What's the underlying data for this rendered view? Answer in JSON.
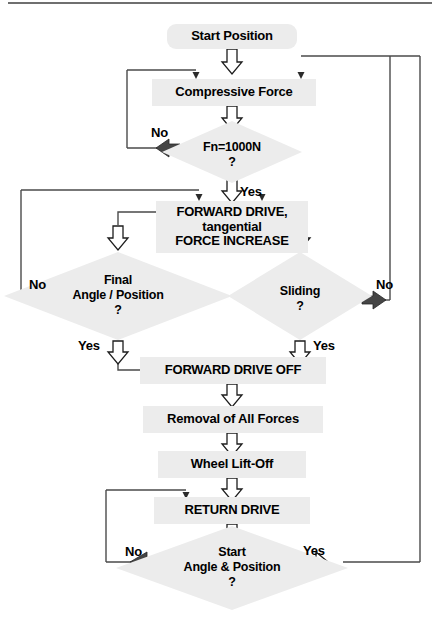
{
  "diagram": {
    "colors": {
      "node_fill": "#ececec",
      "line": "#3b3b3b",
      "arrow_hollow_fill": "#ffffff",
      "arrow_hollow_stroke": "#1a1a1a",
      "arrow_solid_fill": "#404040",
      "text": "#000000",
      "background": "#ffffff"
    },
    "nodes": [
      {
        "id": "start",
        "shape": "rounded-rect",
        "label": "Start Position"
      },
      {
        "id": "compressive",
        "shape": "rect",
        "label": "Compressive Force"
      },
      {
        "id": "fn_check",
        "shape": "diamond",
        "label": "Fn=1000N\n?"
      },
      {
        "id": "forward_drive",
        "shape": "rect",
        "label": "FORWARD DRIVE,\ntangential\nFORCE INCREASE"
      },
      {
        "id": "final_angle",
        "shape": "diamond",
        "label": "Final\nAngle / Position\n?"
      },
      {
        "id": "sliding",
        "shape": "diamond",
        "label": "Sliding\n?"
      },
      {
        "id": "fwd_off",
        "shape": "rect",
        "label": "FORWARD DRIVE OFF"
      },
      {
        "id": "removal",
        "shape": "rect",
        "label": "Removal of All Forces"
      },
      {
        "id": "lift_off",
        "shape": "rect",
        "label": "Wheel Lift-Off"
      },
      {
        "id": "return_drive",
        "shape": "rect",
        "label": "RETURN DRIVE"
      },
      {
        "id": "start_check",
        "shape": "diamond",
        "label": "Start\nAngle & Position\n?"
      }
    ],
    "edge_labels": [
      {
        "id": "fn_no",
        "text": "No",
        "from": "fn_check",
        "to": "compressive"
      },
      {
        "id": "fn_yes",
        "text": "Yes",
        "from": "fn_check",
        "to": "forward_drive"
      },
      {
        "id": "final_no",
        "text": "No",
        "from": "final_angle",
        "to": "forward_drive"
      },
      {
        "id": "final_yes",
        "text": "Yes",
        "from": "final_angle",
        "to": "fwd_off"
      },
      {
        "id": "sliding_no",
        "text": "No",
        "from": "sliding",
        "to": "compressive"
      },
      {
        "id": "sliding_yes",
        "text": "Yes",
        "from": "sliding",
        "to": "fwd_off"
      },
      {
        "id": "start_no",
        "text": "No",
        "from": "start_check",
        "to": "return_drive"
      },
      {
        "id": "start_yes",
        "text": "Yes",
        "from": "start_check",
        "to": "compressive"
      }
    ]
  }
}
